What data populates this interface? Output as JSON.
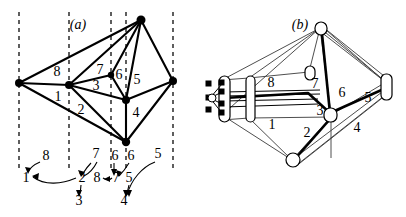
{
  "figure": {
    "panels": [
      {
        "id": "a",
        "caption": "(a)",
        "caption_x": 78,
        "caption_y": 24
      },
      {
        "id": "b",
        "caption": "(b)",
        "caption_x": 300,
        "caption_y": 24
      }
    ],
    "stroke_color": "#000000",
    "fill_color": "#ffffff",
    "dash_color": "#1a1a1a"
  },
  "panel_a": {
    "dashed_lines_x": [
      19,
      69,
      111,
      126,
      173
    ],
    "dashed_top": 12,
    "dashed_bottom": 170,
    "nodes": [
      {
        "name": "node-left",
        "x": 19,
        "y": 83
      },
      {
        "name": "node-hub",
        "x": 69,
        "y": 85
      },
      {
        "name": "node-small7",
        "x": 111,
        "y": 75
      },
      {
        "name": "node-top",
        "x": 141,
        "y": 20
      },
      {
        "name": "node-center",
        "x": 126,
        "y": 100
      },
      {
        "name": "node-bottom",
        "x": 126,
        "y": 142
      },
      {
        "name": "node-right",
        "x": 173,
        "y": 81
      }
    ],
    "face_labels": [
      {
        "text": "8",
        "x": 57,
        "y": 76
      },
      {
        "text": "1",
        "x": 58,
        "y": 101
      },
      {
        "text": "2",
        "x": 81,
        "y": 114
      },
      {
        "text": "3",
        "x": 96,
        "y": 90
      },
      {
        "text": "7",
        "x": 100,
        "y": 74
      },
      {
        "text": "6",
        "x": 119,
        "y": 79
      },
      {
        "text": "5",
        "x": 137,
        "y": 84
      },
      {
        "text": "4",
        "x": 136,
        "y": 117
      }
    ],
    "arrow_labels": [
      {
        "text": "8",
        "x": 43,
        "y": 160
      },
      {
        "text": "7",
        "x": 93,
        "y": 160
      },
      {
        "text": "6",
        "x": 113,
        "y": 160
      },
      {
        "text": "6",
        "x": 131,
        "y": 160
      },
      {
        "text": "5",
        "x": 158,
        "y": 160
      },
      {
        "text": "1",
        "x": 27,
        "y": 181
      },
      {
        "text": "2",
        "x": 82,
        "y": 181
      },
      {
        "text": "8",
        "x": 97,
        "y": 181
      },
      {
        "text": "7",
        "x": 116,
        "y": 181
      },
      {
        "text": "5",
        "x": 129,
        "y": 181
      },
      {
        "text": "3",
        "x": 79,
        "y": 203
      },
      {
        "text": "4",
        "x": 124,
        "y": 203
      }
    ]
  },
  "panel_b": {
    "face_labels": [
      {
        "text": "8",
        "x": 271,
        "y": 82
      },
      {
        "text": "7",
        "x": 315,
        "y": 83
      },
      {
        "text": "6",
        "x": 341,
        "y": 92
      },
      {
        "text": "5",
        "x": 368,
        "y": 97
      },
      {
        "text": "3",
        "x": 320,
        "y": 110
      },
      {
        "text": "1",
        "x": 272,
        "y": 124
      },
      {
        "text": "2",
        "x": 307,
        "y": 132
      },
      {
        "text": "4",
        "x": 357,
        "y": 127
      }
    ]
  }
}
